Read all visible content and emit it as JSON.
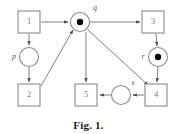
{
  "figure": {
    "caption": "Fig. 1.",
    "type": "petri-net",
    "stroke_color": "#8a8a8a",
    "arc_color": "#6f6f6f",
    "token_color": "#000000",
    "label_color": "#7d7d7d",
    "background": "#ffffff"
  },
  "transitions": [
    {
      "id": "t1",
      "label": "1",
      "x": 29,
      "y": 22,
      "w": 22,
      "h": 22
    },
    {
      "id": "t3",
      "label": "3",
      "x": 153,
      "y": 22,
      "w": 22,
      "h": 22
    },
    {
      "id": "t2",
      "label": "2",
      "x": 29,
      "y": 95,
      "w": 22,
      "h": 22
    },
    {
      "id": "t5",
      "label": "5",
      "x": 86,
      "y": 95,
      "w": 22,
      "h": 22
    },
    {
      "id": "t4",
      "label": "4",
      "x": 156,
      "y": 95,
      "w": 22,
      "h": 22
    }
  ],
  "places": [
    {
      "id": "q",
      "label": "q",
      "x": 80,
      "y": 22,
      "r": 9.5,
      "tokens": 1,
      "label_x": 95,
      "label_y": 8
    },
    {
      "id": "p",
      "label": "p",
      "x": 29,
      "y": 57,
      "r": 9.5,
      "tokens": 0,
      "label_x": 14,
      "label_y": 57
    },
    {
      "id": "r",
      "label": "r",
      "x": 158,
      "y": 57,
      "r": 9.5,
      "tokens": 1,
      "label_x": 143,
      "label_y": 57
    },
    {
      "id": "s",
      "label": "s",
      "x": 121,
      "y": 95,
      "r": 9.5,
      "tokens": 0,
      "label_x": 133,
      "label_y": 83
    }
  ],
  "arcs": [
    {
      "id": "arc-t1-to-q",
      "from": "t1",
      "to": "q",
      "d": "M 41 22 L 68 22"
    },
    {
      "id": "arc-q-to-t3",
      "from": "q",
      "to": "t3",
      "d": "M 90 22 L 140 22"
    },
    {
      "id": "arc-t1-to-p",
      "from": "t1",
      "to": "p",
      "d": "M 29 34 L 29 45"
    },
    {
      "id": "arc-p-to-t2",
      "from": "p",
      "to": "t2",
      "d": "M 29 67 L 29 82"
    },
    {
      "id": "arc-t2-to-q",
      "from": "t2",
      "to": "q",
      "d": "M 41 86 L 73 30"
    },
    {
      "id": "arc-q-to-t5",
      "from": "q",
      "to": "t5",
      "d": "M 86 32 L 86 82"
    },
    {
      "id": "arc-t3-to-r",
      "from": "t3",
      "to": "r",
      "d": "M 156 34 L 157 46"
    },
    {
      "id": "arc-r-to-t4",
      "from": "r",
      "to": "t4",
      "d": "M 158 67 L 157 82"
    },
    {
      "id": "arc-q-to-t4",
      "from": "q",
      "to": "t4",
      "d": "M 88 30 L 148 85"
    },
    {
      "id": "arc-t4-to-s",
      "from": "t4",
      "to": "s",
      "d": "M 144 95 L 133 95"
    },
    {
      "id": "arc-s-to-t5",
      "from": "s",
      "to": "t5",
      "d": "M 111 95 L 100 95"
    }
  ]
}
